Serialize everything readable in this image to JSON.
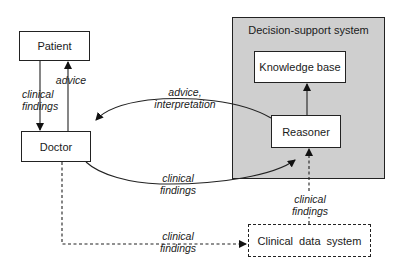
{
  "diagram": {
    "nodes": {
      "patient": "Patient",
      "doctor": "Doctor",
      "dss": "Decision-support system",
      "knowledge_base": "Knowledge base",
      "reasoner": "Reasoner",
      "clinical_data_system": "Clinical data system"
    },
    "edges": [
      {
        "from": "patient",
        "to": "doctor",
        "label_line1": "clinical",
        "label_line2": "findings",
        "style": "solid"
      },
      {
        "from": "doctor",
        "to": "patient",
        "label_line1": "advice",
        "style": "solid"
      },
      {
        "from": "reasoner",
        "to": "doctor",
        "label_line1": "advice,",
        "label_line2": "interpretation",
        "style": "solid-curve"
      },
      {
        "from": "doctor",
        "to": "reasoner",
        "label_line1": "clinical",
        "label_line2": "findings",
        "style": "solid-curve"
      },
      {
        "from": "reasoner",
        "to": "knowledge_base",
        "style": "solid"
      },
      {
        "from": "doctor",
        "to": "clinical_data_system",
        "label_line1": "clinical",
        "label_line2": "findings",
        "style": "dashed"
      },
      {
        "from": "clinical_data_system",
        "to": "reasoner",
        "label_line1": "clinical",
        "label_line2": "findings",
        "style": "dashed"
      }
    ]
  }
}
